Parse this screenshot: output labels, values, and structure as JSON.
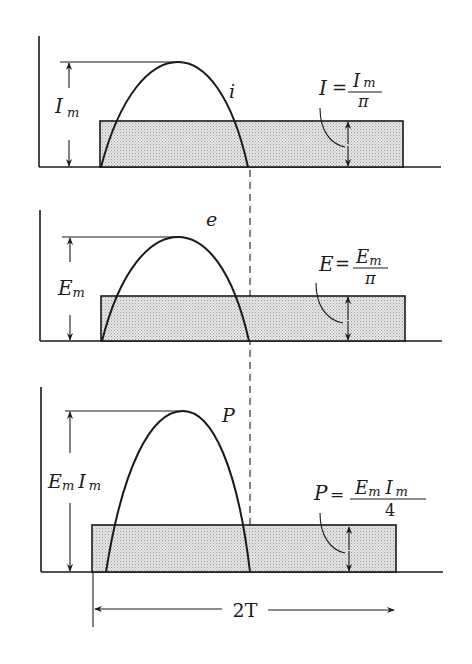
{
  "figure": {
    "colors": {
      "ink": "#1a1a1a",
      "fill": "#d9d9d9",
      "background": "#ffffff"
    }
  },
  "panels": [
    {
      "id": "current",
      "curve_label": "i",
      "peak_label": {
        "main": "I",
        "sub": "m"
      },
      "average_formula": {
        "lhs": "I",
        "eq": "=",
        "num_main": "I",
        "num_sub": "m",
        "den": "π"
      }
    },
    {
      "id": "voltage",
      "curve_label": "e",
      "peak_label": {
        "main": "E",
        "sub": "m"
      },
      "average_formula": {
        "lhs": "E",
        "eq": "=",
        "num_main": "E",
        "num_sub": "m",
        "den": "π"
      }
    },
    {
      "id": "power",
      "curve_label": "P",
      "peak_label": {
        "main1": "E",
        "sub1": "m",
        "main2": "I",
        "sub2": "m"
      },
      "average_formula": {
        "lhs": "P",
        "eq": "=",
        "num_main1": "E",
        "num_sub1": "m",
        "num_main2": "I",
        "num_sub2": "m",
        "den": "4"
      }
    }
  ],
  "period": {
    "label": "2T"
  }
}
